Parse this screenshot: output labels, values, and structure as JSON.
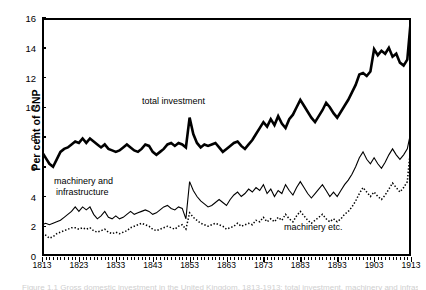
{
  "axes": {
    "ylabel": "Per cent of GNP",
    "yticks": [
      "0",
      "2",
      "4",
      "6",
      "8",
      "10",
      "12",
      "14",
      "16"
    ],
    "xticks": [
      "1813",
      "1823",
      "1833",
      "1843",
      "1853",
      "1863",
      "1873",
      "1883",
      "1893",
      "1903",
      "1913"
    ]
  },
  "annotations": [
    {
      "name": "total-investment",
      "text": "total investment"
    },
    {
      "name": "machinery-and-infrastructure",
      "text": "machinery and"
    },
    {
      "name": "machinery-and-infrastructure-2",
      "text": "infrastructure"
    },
    {
      "name": "machinery-etc",
      "text": "machinery etc."
    }
  ],
  "caption": {
    "text": "Figure 1.1  Gross domestic investment in the United Kingdom, 1813-1913: total investment, machinery and infrastructure, and machinery etc."
  },
  "chart_data": {
    "type": "line",
    "title": "",
    "xlabel": "",
    "ylabel": "Per cent of GNP",
    "xlim": [
      1813,
      1913
    ],
    "ylim": [
      0,
      16
    ],
    "grid": false,
    "legend": "in-plot annotations",
    "x": [
      1813,
      1814,
      1815,
      1816,
      1817,
      1818,
      1819,
      1820,
      1821,
      1822,
      1823,
      1824,
      1825,
      1826,
      1827,
      1828,
      1829,
      1830,
      1831,
      1832,
      1833,
      1834,
      1835,
      1836,
      1837,
      1838,
      1839,
      1840,
      1841,
      1842,
      1843,
      1844,
      1845,
      1846,
      1847,
      1848,
      1849,
      1850,
      1851,
      1852,
      1853,
      1854,
      1855,
      1856,
      1857,
      1858,
      1859,
      1860,
      1861,
      1862,
      1863,
      1864,
      1865,
      1866,
      1867,
      1868,
      1869,
      1870,
      1871,
      1872,
      1873,
      1874,
      1875,
      1876,
      1877,
      1878,
      1879,
      1880,
      1881,
      1882,
      1883,
      1884,
      1885,
      1886,
      1887,
      1888,
      1889,
      1890,
      1891,
      1892,
      1893,
      1894,
      1895,
      1896,
      1897,
      1898,
      1899,
      1900,
      1901,
      1902,
      1903,
      1904,
      1905,
      1906,
      1907,
      1908,
      1909,
      1910,
      1911,
      1912,
      1913
    ],
    "series": [
      {
        "name": "total investment",
        "style": "thick-solid",
        "values": [
          7.0,
          6.6,
          6.2,
          6.0,
          6.5,
          7.0,
          7.2,
          7.3,
          7.5,
          7.7,
          7.6,
          7.9,
          7.6,
          7.9,
          7.7,
          7.5,
          7.3,
          7.5,
          7.2,
          7.1,
          7.0,
          7.1,
          7.3,
          7.5,
          7.3,
          7.1,
          7.0,
          7.2,
          7.5,
          7.4,
          7.0,
          6.8,
          7.0,
          7.2,
          7.5,
          7.6,
          7.4,
          7.6,
          7.5,
          7.3,
          9.3,
          8.2,
          7.6,
          7.3,
          7.5,
          7.4,
          7.5,
          7.6,
          7.3,
          7.0,
          7.2,
          7.4,
          7.6,
          7.7,
          7.4,
          7.2,
          7.5,
          7.8,
          8.2,
          8.6,
          9.0,
          8.7,
          9.2,
          8.8,
          9.4,
          8.9,
          8.6,
          9.2,
          9.5,
          10.0,
          10.5,
          10.1,
          9.7,
          9.3,
          9.0,
          9.4,
          9.8,
          10.3,
          10.0,
          9.6,
          9.3,
          9.7,
          10.1,
          10.5,
          11.0,
          11.5,
          12.2,
          12.3,
          12.1,
          12.4,
          13.9,
          13.5,
          13.8,
          13.6,
          14.0,
          13.4,
          13.6,
          13.0,
          12.8,
          13.2,
          16.0
        ]
      },
      {
        "name": "machinery and infrastructure",
        "style": "thin-solid",
        "values": [
          2.1,
          2.2,
          2.1,
          2.2,
          2.3,
          2.4,
          2.6,
          2.8,
          3.0,
          3.3,
          3.0,
          3.3,
          3.1,
          3.3,
          2.8,
          2.5,
          2.7,
          3.0,
          2.6,
          2.5,
          2.7,
          2.5,
          2.6,
          2.8,
          3.0,
          2.8,
          2.9,
          3.0,
          3.1,
          3.0,
          2.8,
          2.9,
          3.1,
          3.3,
          3.4,
          3.2,
          3.1,
          3.3,
          3.2,
          2.5,
          5.0,
          4.4,
          4.0,
          3.7,
          3.5,
          3.3,
          3.4,
          3.6,
          3.8,
          3.6,
          3.4,
          3.8,
          4.1,
          4.3,
          4.0,
          4.2,
          4.5,
          4.3,
          4.6,
          4.4,
          4.8,
          4.2,
          4.5,
          4.0,
          4.4,
          4.2,
          4.8,
          4.4,
          4.1,
          4.6,
          5.0,
          4.6,
          4.2,
          3.9,
          4.2,
          4.5,
          4.8,
          4.4,
          4.0,
          4.3,
          4.0,
          4.4,
          4.8,
          5.1,
          5.5,
          6.0,
          6.6,
          7.0,
          6.5,
          6.2,
          6.6,
          6.2,
          5.9,
          6.3,
          6.8,
          7.2,
          6.8,
          6.5,
          6.8,
          7.2,
          8.4
        ]
      },
      {
        "name": "machinery etc.",
        "style": "dotted",
        "values": [
          1.5,
          1.4,
          1.2,
          1.3,
          1.5,
          1.6,
          1.7,
          1.8,
          1.9,
          1.9,
          1.8,
          1.9,
          1.8,
          1.9,
          1.7,
          1.6,
          1.7,
          1.8,
          1.6,
          1.5,
          1.6,
          1.5,
          1.6,
          1.7,
          1.9,
          2.0,
          2.1,
          2.2,
          2.1,
          2.0,
          1.8,
          1.7,
          1.8,
          1.9,
          2.0,
          1.9,
          1.8,
          2.0,
          2.1,
          1.8,
          2.9,
          2.6,
          2.4,
          2.2,
          2.1,
          2.0,
          2.1,
          2.2,
          2.1,
          2.0,
          1.8,
          1.9,
          2.0,
          2.2,
          2.0,
          2.1,
          2.2,
          2.1,
          2.4,
          2.3,
          2.6,
          2.3,
          2.5,
          2.3,
          2.6,
          2.4,
          2.8,
          2.5,
          2.3,
          2.7,
          3.0,
          2.7,
          2.4,
          2.2,
          2.4,
          2.6,
          2.8,
          2.5,
          2.3,
          2.5,
          2.3,
          2.5,
          2.8,
          3.0,
          3.3,
          3.7,
          4.2,
          4.6,
          4.3,
          4.0,
          4.3,
          4.0,
          3.8,
          4.1,
          4.5,
          4.9,
          4.6,
          4.3,
          4.6,
          5.0,
          7.6
        ]
      }
    ]
  }
}
